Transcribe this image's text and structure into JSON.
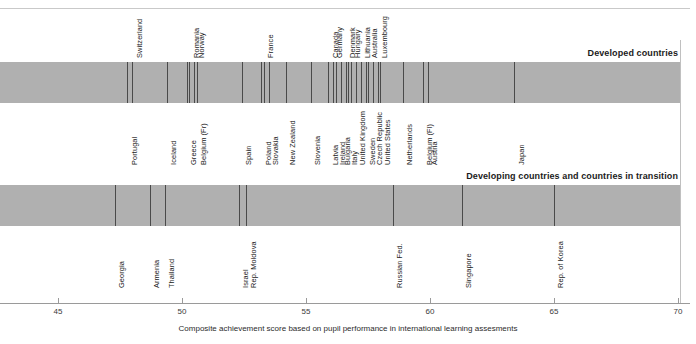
{
  "chart_data": {
    "type": "scatter",
    "title": "",
    "xlabel": "Composite achievement score based on pupil performance in international learning assesments",
    "ylabel": "",
    "xlim": [
      43.3,
      70.9
    ],
    "xticks": [
      45,
      50,
      55,
      60,
      65,
      70
    ],
    "xticklabels": [
      "45",
      "50",
      "55",
      "60",
      "65",
      "70"
    ],
    "grid": false,
    "legend": "none",
    "orientation": "horizontal-strip",
    "panels": [
      {
        "name": "developed",
        "label": "Developed countries",
        "points": [
          {
            "name": "Portugal",
            "value": 47.8,
            "side": "below"
          },
          {
            "name": "Switzerland",
            "value": 48.0,
            "side": "above"
          },
          {
            "name": "Iceland",
            "value": 49.4,
            "side": "below"
          },
          {
            "name": "Greece",
            "value": 50.2,
            "side": "below"
          },
          {
            "name": "Romania",
            "value": 50.3,
            "side": "above"
          },
          {
            "name": "Norway",
            "value": 50.5,
            "side": "above"
          },
          {
            "name": "Belgium (Fr)",
            "value": 50.6,
            "side": "below"
          },
          {
            "name": "Spain",
            "value": 52.4,
            "side": "below"
          },
          {
            "name": "Poland",
            "value": 53.2,
            "side": "below"
          },
          {
            "name": "France",
            "value": 53.3,
            "side": "above"
          },
          {
            "name": "Slovakia",
            "value": 53.5,
            "side": "below"
          },
          {
            "name": "New Zealand",
            "value": 54.2,
            "side": "below"
          },
          {
            "name": "Slovenia",
            "value": 55.2,
            "side": "below"
          },
          {
            "name": "Canada",
            "value": 55.9,
            "side": "above"
          },
          {
            "name": "Latvia",
            "value": 55.9,
            "side": "below"
          },
          {
            "name": "Germany",
            "value": 56.1,
            "side": "above"
          },
          {
            "name": "Ireland",
            "value": 56.2,
            "side": "below"
          },
          {
            "name": "Bulgaria",
            "value": 56.4,
            "side": "below"
          },
          {
            "name": "Denmark",
            "value": 56.6,
            "side": "above"
          },
          {
            "name": "Italy",
            "value": 56.7,
            "side": "below"
          },
          {
            "name": "Hungary",
            "value": 56.8,
            "side": "above"
          },
          {
            "name": "United Kingdom",
            "value": 57.0,
            "side": "below"
          },
          {
            "name": "Lithuania",
            "value": 57.2,
            "side": "above"
          },
          {
            "name": "Sweden",
            "value": 57.4,
            "side": "below"
          },
          {
            "name": "Australia",
            "value": 57.5,
            "side": "above"
          },
          {
            "name": "Czech Republic",
            "value": 57.7,
            "side": "below"
          },
          {
            "name": "Luxembourg",
            "value": 57.9,
            "side": "above"
          },
          {
            "name": "United States",
            "value": 58.0,
            "side": "below"
          },
          {
            "name": "Netherlands",
            "value": 58.9,
            "side": "below"
          },
          {
            "name": "Belgium (Fl)",
            "value": 59.7,
            "side": "below"
          },
          {
            "name": "Austria",
            "value": 59.9,
            "side": "below"
          },
          {
            "name": "Japan",
            "value": 63.4,
            "side": "below"
          }
        ]
      },
      {
        "name": "developing",
        "label": "Developing countries and countries in transition",
        "points": [
          {
            "name": "Georgia",
            "value": 47.3,
            "side": "below"
          },
          {
            "name": "Armenia",
            "value": 48.7,
            "side": "below"
          },
          {
            "name": "Thailand",
            "value": 49.3,
            "side": "below"
          },
          {
            "name": "Israel",
            "value": 52.3,
            "side": "below"
          },
          {
            "name": "Rep. Moldova",
            "value": 52.6,
            "side": "below"
          },
          {
            "name": "Russian Fed.",
            "value": 58.5,
            "side": "below"
          },
          {
            "name": "Singapore",
            "value": 61.3,
            "side": "below"
          },
          {
            "name": "Rep. of Korea",
            "value": 65.0,
            "side": "below"
          }
        ]
      }
    ]
  },
  "colors": {
    "band": "#b0b0b0",
    "tickline": "#4a4a4a",
    "axis": "#9a9a9a",
    "text": "#1b1b1b",
    "rule": "#c9c9c9"
  }
}
